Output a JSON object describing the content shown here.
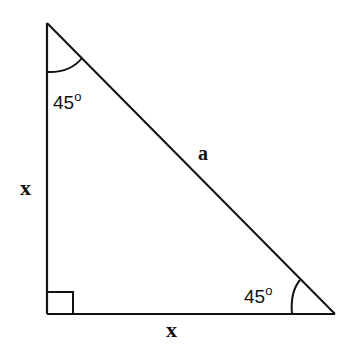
{
  "diagram": {
    "type": "right-isosceles-triangle",
    "vertices": {
      "top": [
        47,
        23
      ],
      "bottom_left": [
        47,
        314
      ],
      "bottom_right": [
        335,
        314
      ]
    },
    "line_color": "#111111",
    "background": "#ffffff",
    "sides": {
      "vertical_leg": {
        "label": "x"
      },
      "horizontal_leg": {
        "label": "x"
      },
      "hypotenuse": {
        "label": "a"
      }
    },
    "angles": {
      "top": {
        "value": "45",
        "degree_symbol": "o"
      },
      "bottom_right": {
        "value": "45",
        "degree_symbol": "o"
      },
      "bottom_left": {
        "marker": "right-angle-square"
      }
    }
  }
}
